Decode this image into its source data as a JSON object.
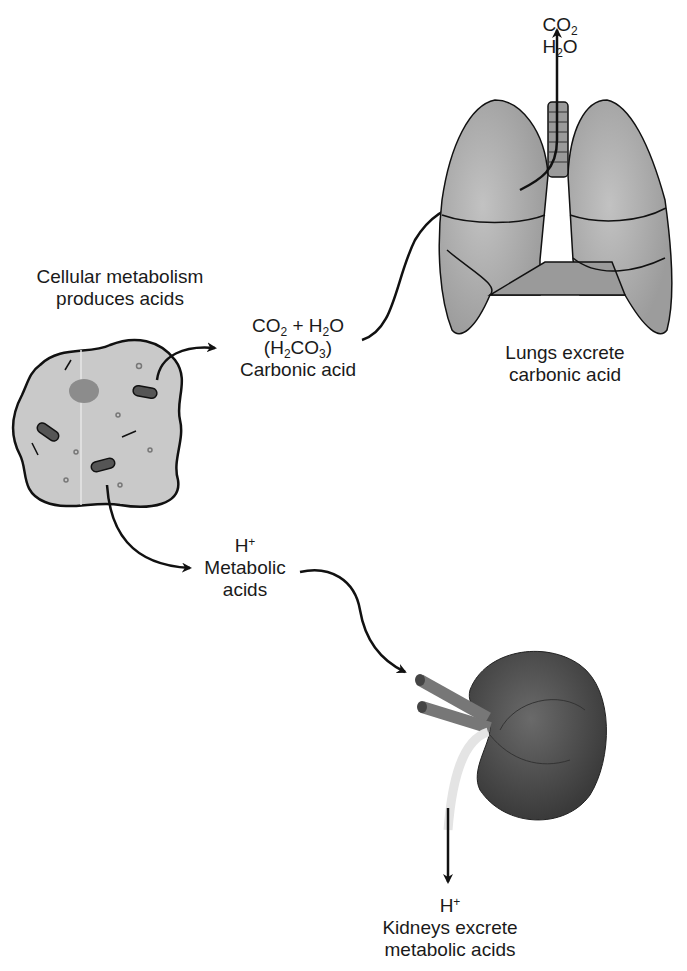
{
  "figure": {
    "top_label": {
      "line1_base": "CO",
      "line1_sub": "2",
      "line2_pre": "H",
      "line2_sub": "2",
      "line2_post": "O"
    },
    "cell_label": {
      "line1": "Cellular metabolism",
      "line2": "produces acids"
    },
    "carbonic": {
      "co2": "CO",
      "co2_sub": "2",
      "plus": " + H",
      "h2o_sub": "2",
      "h2o_end": "O",
      "paren_open": "(H",
      "h2co3_sub1": "2",
      "h2co3_mid": "CO",
      "h2co3_sub2": "3",
      "paren_close": ")",
      "name": "Carbonic acid"
    },
    "lungs_label": {
      "line1": "Lungs excrete",
      "line2": "carbonic acid"
    },
    "metabolic": {
      "h": "H",
      "plus": "+",
      "line2": "Metabolic",
      "line3": "acids"
    },
    "kidney_label": {
      "h": "H",
      "plus": "+",
      "line2": "Kidneys excrete",
      "line3": "metabolic acids"
    },
    "colors": {
      "cell_fill": "#c9c9c9",
      "lung_fill": "#a9a9a9",
      "kidney_fill": "#4a4a4a",
      "ink": "#111111"
    }
  }
}
